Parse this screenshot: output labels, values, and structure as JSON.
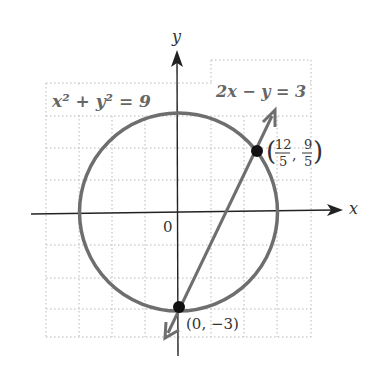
{
  "figure": {
    "type": "system-of-equations-graph",
    "axes": {
      "x_label": "x",
      "y_label": "y",
      "origin_label": "0"
    },
    "grid": {
      "cell_px": 33,
      "color": "#b8b8b8",
      "style": "dotted"
    },
    "curves": [
      {
        "name": "circle",
        "equation_label": "x² + y² = 9",
        "center": [
          0,
          0
        ],
        "radius": 3,
        "color": "#6e6e6e"
      },
      {
        "name": "line",
        "equation_label": "2x − y = 3",
        "slope": 2,
        "intercept": -3,
        "color": "#6e6e6e"
      }
    ],
    "intersection_points": [
      {
        "label": "(0, −3)",
        "x": 0,
        "y": -3
      },
      {
        "label_num_x": "12",
        "label_den_x": "5",
        "label_num_y": "9",
        "label_den_y": "5",
        "x": 2.4,
        "y": 1.8
      }
    ]
  }
}
